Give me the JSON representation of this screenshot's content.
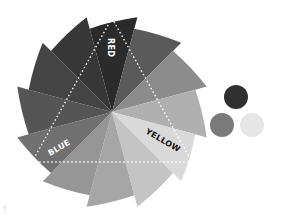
{
  "wheel": {
    "center": [
      112,
      112
    ],
    "radius": 98,
    "segments": [
      {
        "name": "red",
        "color": "#2b2b2b"
      },
      {
        "name": "red-orange",
        "color": "#5a5a5a"
      },
      {
        "name": "orange",
        "color": "#8c8c8c"
      },
      {
        "name": "yellow-orange",
        "color": "#b0b0b0"
      },
      {
        "name": "yellow",
        "color": "#d9d9d9"
      },
      {
        "name": "yellow-green",
        "color": "#c4c4c4"
      },
      {
        "name": "green",
        "color": "#a6a6a6"
      },
      {
        "name": "blue-green",
        "color": "#969696"
      },
      {
        "name": "blue",
        "color": "#707070"
      },
      {
        "name": "blue-violet",
        "color": "#555555"
      },
      {
        "name": "violet",
        "color": "#444444"
      },
      {
        "name": "red-violet",
        "color": "#373737"
      }
    ]
  },
  "labels": {
    "red": "RED",
    "yellow": "YELLOW",
    "blue": "BLUE"
  },
  "swatches": [
    {
      "name": "red",
      "color": "#303030"
    },
    {
      "name": "blue",
      "color": "#7a7a7a"
    },
    {
      "name": "yellow",
      "color": "#e6e6e6"
    }
  ],
  "footer_mark": "!"
}
